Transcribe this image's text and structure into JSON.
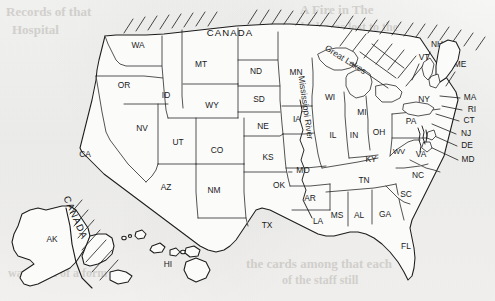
{
  "figure": {
    "kind": "reference-map",
    "medium": "scanned line-art page, off-white paper",
    "background_color": "#f2f2f0",
    "ink_color": "#1c1c1c"
  },
  "countries": [
    {
      "name": "CANADA",
      "placement": "northern-border",
      "style": "horizontal"
    },
    {
      "name": "CANADA",
      "placement": "alaska-eastern-border",
      "style": "rotated"
    }
  ],
  "features": [
    {
      "name": "Great Lakes",
      "type": "lakes",
      "label_style": "curved"
    },
    {
      "name": "Mississippi River",
      "type": "river",
      "label_style": "rotated-vertical"
    }
  ],
  "states": [
    {
      "abbr": "WA",
      "x": 138,
      "y": 46
    },
    {
      "abbr": "OR",
      "x": 124,
      "y": 86
    },
    {
      "abbr": "ID",
      "x": 166,
      "y": 96
    },
    {
      "abbr": "MT",
      "x": 201,
      "y": 65
    },
    {
      "abbr": "WY",
      "x": 212,
      "y": 106
    },
    {
      "abbr": "ND",
      "x": 256,
      "y": 72
    },
    {
      "abbr": "SD",
      "x": 259,
      "y": 100
    },
    {
      "abbr": "NE",
      "x": 263,
      "y": 127
    },
    {
      "abbr": "MN",
      "x": 296,
      "y": 73
    },
    {
      "abbr": "IA",
      "x": 297,
      "y": 120
    },
    {
      "abbr": "NV",
      "x": 142,
      "y": 129
    },
    {
      "abbr": "UT",
      "x": 178,
      "y": 143
    },
    {
      "abbr": "CO",
      "x": 217,
      "y": 151
    },
    {
      "abbr": "KS",
      "x": 268,
      "y": 158
    },
    {
      "abbr": "CA",
      "x": 85,
      "y": 155
    },
    {
      "abbr": "AZ",
      "x": 166,
      "y": 188
    },
    {
      "abbr": "NM",
      "x": 214,
      "y": 191
    },
    {
      "abbr": "OK",
      "x": 279,
      "y": 186
    },
    {
      "abbr": "TX",
      "x": 267,
      "y": 226
    },
    {
      "abbr": "MO",
      "x": 303,
      "y": 171
    },
    {
      "abbr": "AR",
      "x": 310,
      "y": 199
    },
    {
      "abbr": "LA",
      "x": 318,
      "y": 222
    },
    {
      "abbr": "WI",
      "x": 330,
      "y": 98
    },
    {
      "abbr": "IL",
      "x": 333,
      "y": 136
    },
    {
      "abbr": "IN",
      "x": 354,
      "y": 136
    },
    {
      "abbr": "MI",
      "x": 362,
      "y": 113
    },
    {
      "abbr": "OH",
      "x": 379,
      "y": 133
    },
    {
      "abbr": "KY",
      "x": 371,
      "y": 160
    },
    {
      "abbr": "TN",
      "x": 364,
      "y": 181
    },
    {
      "abbr": "MS",
      "x": 337,
      "y": 216
    },
    {
      "abbr": "AL",
      "x": 359,
      "y": 216
    },
    {
      "abbr": "GA",
      "x": 385,
      "y": 215
    },
    {
      "abbr": "FL",
      "x": 406,
      "y": 247
    },
    {
      "abbr": "SC",
      "x": 406,
      "y": 195
    },
    {
      "abbr": "NC",
      "x": 418,
      "y": 176
    },
    {
      "abbr": "WV",
      "x": 399,
      "y": 152
    },
    {
      "abbr": "VA",
      "x": 421,
      "y": 155
    },
    {
      "abbr": "PA",
      "x": 411,
      "y": 122
    },
    {
      "abbr": "NY",
      "x": 424,
      "y": 100
    },
    {
      "abbr": "AK",
      "x": 52,
      "y": 240
    },
    {
      "abbr": "HI",
      "x": 168,
      "y": 265
    }
  ],
  "leader_labels": [
    {
      "abbr": "NH",
      "x": 437,
      "y": 45
    },
    {
      "abbr": "VT",
      "x": 424,
      "y": 58
    },
    {
      "abbr": "ME",
      "x": 460,
      "y": 65
    },
    {
      "abbr": "MA",
      "x": 470,
      "y": 98
    },
    {
      "abbr": "RI",
      "x": 472,
      "y": 110
    },
    {
      "abbr": "CT",
      "x": 469,
      "y": 121
    },
    {
      "abbr": "NJ",
      "x": 466,
      "y": 134
    },
    {
      "abbr": "DE",
      "x": 467,
      "y": 146
    },
    {
      "abbr": "MD",
      "x": 468,
      "y": 160
    }
  ],
  "show_through_text": [
    {
      "text": "Records of that",
      "x": 6,
      "y": 10
    },
    {
      "text": "Hospital",
      "x": 12,
      "y": 28
    },
    {
      "text": "A Fire in The",
      "x": 300,
      "y": 8
    },
    {
      "text": "which was lost to the",
      "x": 292,
      "y": 26
    },
    {
      "text": "the cards among that each",
      "x": 246,
      "y": 262
    },
    {
      "text": "of the staff still",
      "x": 282,
      "y": 279
    },
    {
      "text": "ways Full of a form",
      "x": 8,
      "y": 272
    }
  ]
}
